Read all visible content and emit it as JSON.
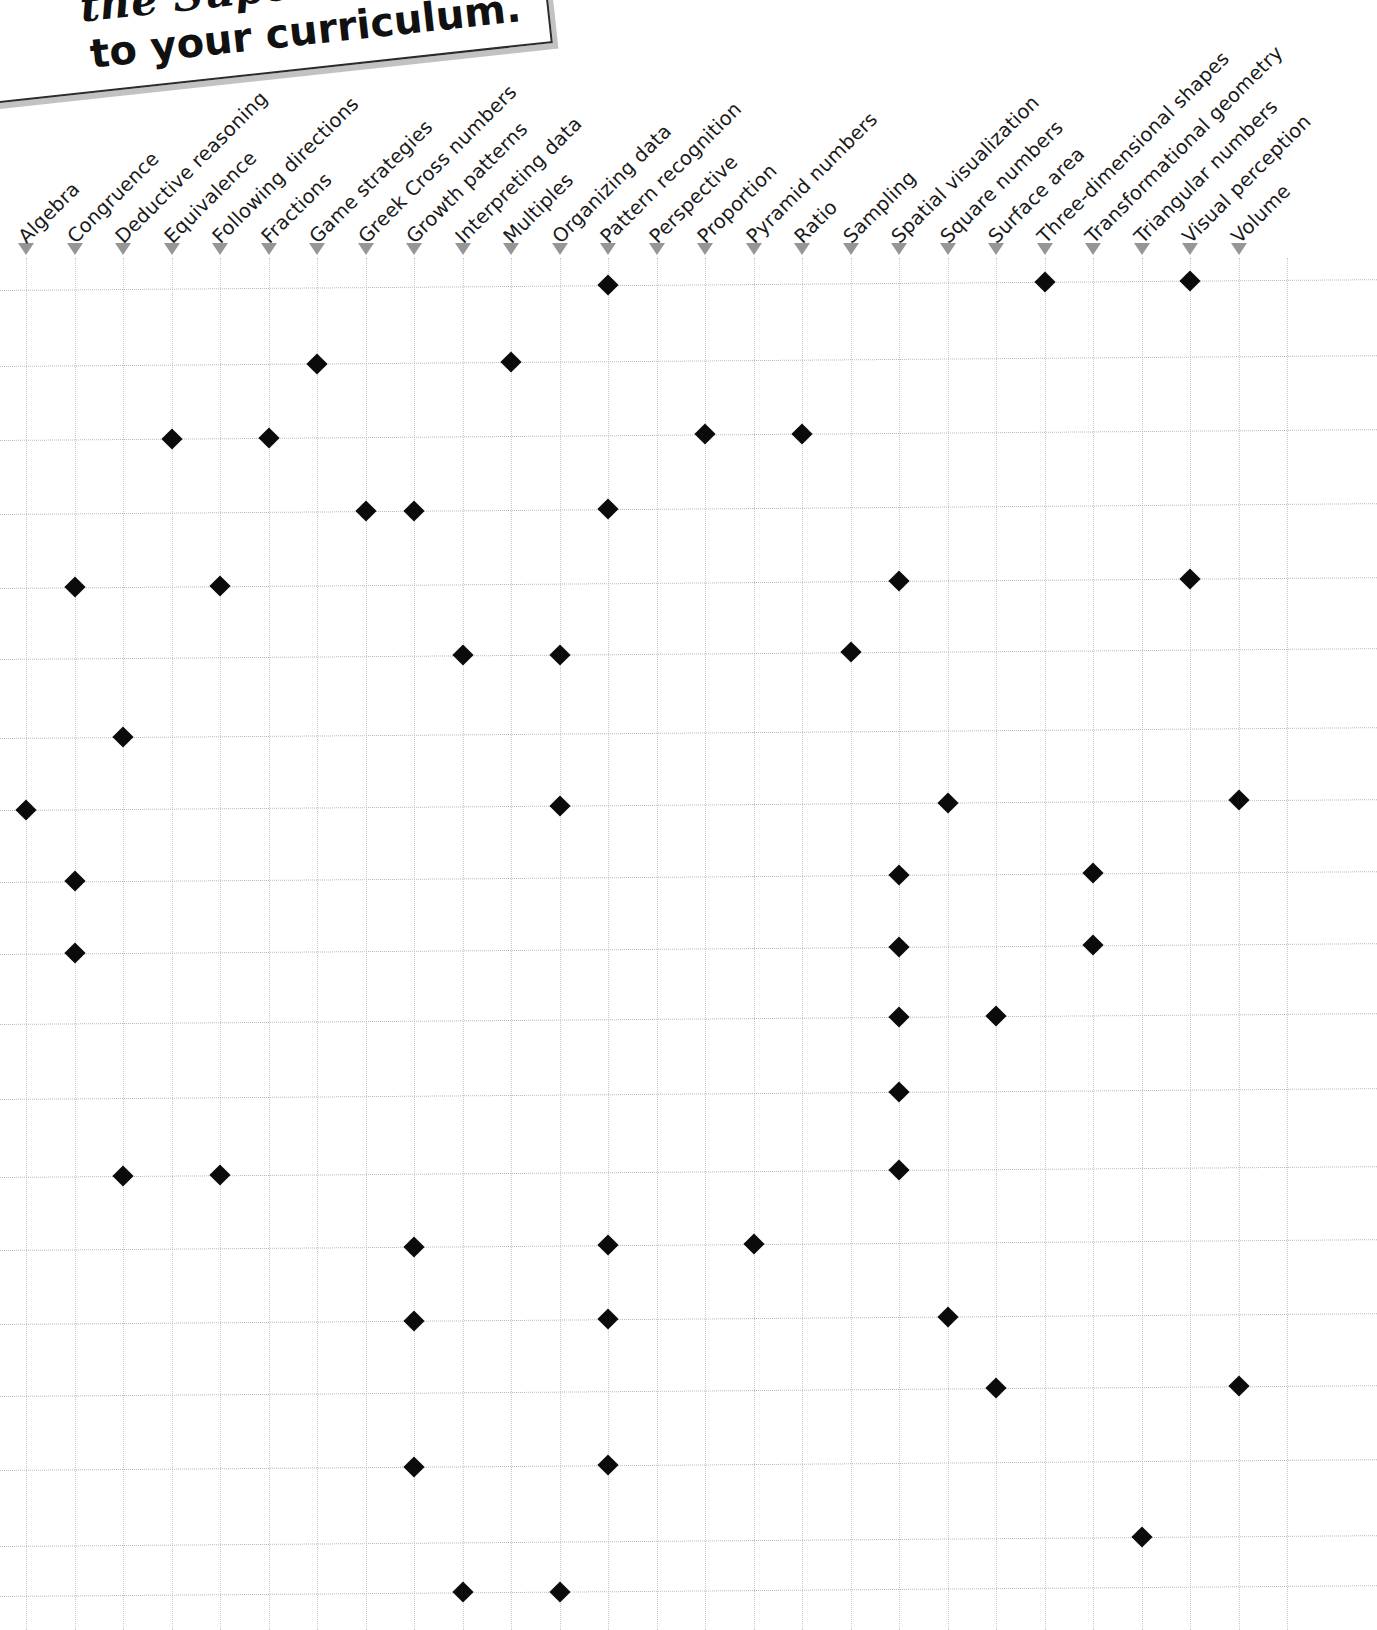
{
  "note": {
    "line1": "the Supe",
    "line2": "to your curriculum."
  },
  "colors": {
    "marker": "#0b0b0b",
    "grid": "#c9c9c9",
    "pointer": "#6d6d6d",
    "text": "#1a1a1a"
  },
  "icons": {
    "pointer": "triangle-down-icon",
    "marker": "diamond-marker-icon"
  },
  "chart_data": {
    "type": "table",
    "title": "",
    "xlabel": "",
    "ylabel": "",
    "grid": true,
    "legend": "none",
    "categories": [
      "Algebra",
      "Congruence",
      "Deductive reasoning",
      "Equivalence",
      "Following directions",
      "Fractions",
      "Game strategies",
      "Greek Cross numbers",
      "Growth patterns",
      "Interpreting data",
      "Multiples",
      "Organizing data",
      "Pattern recognition",
      "Perspective",
      "Proportion",
      "Pyramid numbers",
      "Ratio",
      "Sampling",
      "Spatial visualization",
      "Square numbers",
      "Surface area",
      "Three-dimensional shapes",
      "Transformational geometry",
      "Triangular numbers",
      "Visual perception",
      "Volume"
    ],
    "row_count": 19,
    "rows": [
      {
        "y": 290,
        "marks": [
          12,
          21,
          24
        ]
      },
      {
        "y": 366,
        "marks": [
          6,
          10
        ]
      },
      {
        "y": 440,
        "marks": [
          3,
          5,
          14,
          16
        ]
      },
      {
        "y": 514,
        "marks": [
          7,
          8,
          12
        ]
      },
      {
        "y": 588,
        "marks": [
          1,
          4,
          18,
          24
        ]
      },
      {
        "y": 659,
        "marks": [
          9,
          11,
          17
        ]
      },
      {
        "y": 738,
        "marks": [
          2
        ]
      },
      {
        "y": 810,
        "marks": [
          0,
          11,
          19,
          25
        ]
      },
      {
        "y": 882,
        "marks": [
          1,
          18,
          22
        ]
      },
      {
        "y": 954,
        "marks": [
          1,
          18,
          22
        ]
      },
      {
        "y": 1024,
        "marks": [
          18,
          20
        ]
      },
      {
        "y": 1099,
        "marks": [
          18
        ]
      },
      {
        "y": 1177,
        "marks": [
          2,
          4,
          18
        ]
      },
      {
        "y": 1250,
        "marks": [
          8,
          12,
          15
        ]
      },
      {
        "y": 1324,
        "marks": [
          8,
          12,
          19
        ]
      },
      {
        "y": 1396,
        "marks": [
          20,
          25
        ]
      },
      {
        "y": 1470,
        "marks": [
          8,
          12
        ]
      },
      {
        "y": 1546,
        "marks": [
          23
        ]
      },
      {
        "y": 1596,
        "marks": [
          9,
          11
        ]
      }
    ],
    "axis_x_start_px": 26,
    "axis_x_step_px": 48.5
  }
}
